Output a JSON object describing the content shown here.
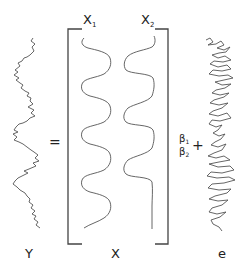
{
  "diagram": {
    "equation": {
      "lhs_label": "Y",
      "equals": "=",
      "matrix_label": "X",
      "columns": [
        {
          "name": "X",
          "subscript": "1"
        },
        {
          "name": "X",
          "subscript": "2"
        }
      ],
      "coefficients": [
        {
          "symbol": "β",
          "subscript": "1"
        },
        {
          "symbol": "β",
          "subscript": "2"
        }
      ],
      "plus": "+",
      "error_label": "e"
    },
    "colors": {
      "stroke": "#555555",
      "text": "#222222",
      "background": "#ffffff"
    }
  }
}
